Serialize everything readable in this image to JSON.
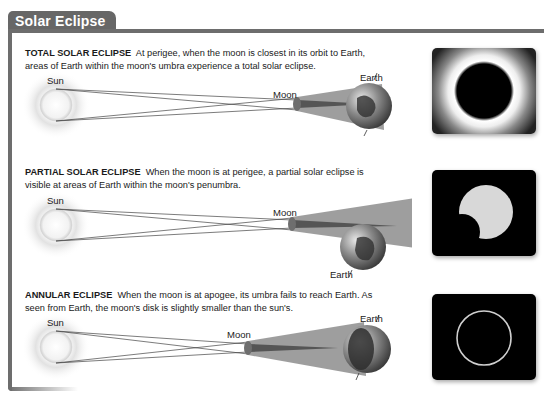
{
  "header": {
    "title": "Solar Eclipse"
  },
  "sections": [
    {
      "id": "total",
      "heading": "TOTAL SOLAR ECLIPSE",
      "text": "At perigee, when the moon is closest in its orbit to Earth,",
      "text2": "areas of Earth within the moon's umbra experience a total solar eclipse.",
      "labels": {
        "sun": "Sun",
        "moon": "Moon",
        "earth": "Earth"
      },
      "photo": "total-eclipse-photo"
    },
    {
      "id": "partial",
      "heading": "PARTIAL SOLAR ECLIPSE",
      "text": "When the moon is at perigee, a partial solar eclipse is",
      "text2": "visible at areas of Earth within the moon's penumbra.",
      "labels": {
        "sun": "Sun",
        "moon": "Moon",
        "earth": "Earth"
      },
      "photo": "partial-eclipse-photo"
    },
    {
      "id": "annular",
      "heading": "ANNULAR ECLIPSE",
      "text": "When the moon is at apogee, its umbra fails to reach Earth. As",
      "text2": "seen from Earth, the moon's disk is slightly smaller than the sun's.",
      "labels": {
        "sun": "Sun",
        "moon": "Moon",
        "earth": "Earth"
      },
      "photo": "annular-eclipse-photo"
    }
  ],
  "colors": {
    "frame": "#6d6d6d",
    "shadow": "#8a8a8a",
    "umbra": "#4a4a4a"
  }
}
